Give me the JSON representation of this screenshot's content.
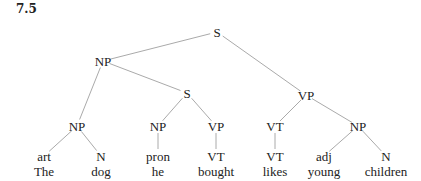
{
  "figure": {
    "label": "7.5"
  },
  "tree": {
    "nodes": [
      {
        "id": "s_root",
        "label": "S",
        "x": 217,
        "y": 32
      },
      {
        "id": "np_subj",
        "label": "NP",
        "x": 103,
        "y": 61
      },
      {
        "id": "vp_main",
        "label": "VP",
        "x": 306,
        "y": 95
      },
      {
        "id": "s_rel",
        "label": "S",
        "x": 187,
        "y": 93
      },
      {
        "id": "np_det",
        "label": "NP",
        "x": 77,
        "y": 126
      },
      {
        "id": "art",
        "label": "art",
        "x": 44,
        "y": 156
      },
      {
        "id": "n_dog",
        "label": "N",
        "x": 101,
        "y": 156
      },
      {
        "id": "np_he",
        "label": "NP",
        "x": 158,
        "y": 126
      },
      {
        "id": "pron",
        "label": "pron",
        "x": 158,
        "y": 156
      },
      {
        "id": "vp_rel",
        "label": "VP",
        "x": 216,
        "y": 126
      },
      {
        "id": "vt_bought",
        "label": "VT",
        "x": 216,
        "y": 156
      },
      {
        "id": "vt_main",
        "label": "VT",
        "x": 275,
        "y": 126
      },
      {
        "id": "vt_likes",
        "label": "VT",
        "x": 275,
        "y": 156
      },
      {
        "id": "np_obj",
        "label": "NP",
        "x": 358,
        "y": 126
      },
      {
        "id": "adj",
        "label": "adj",
        "x": 324,
        "y": 156
      },
      {
        "id": "n_children",
        "label": "N",
        "x": 386,
        "y": 156
      }
    ],
    "edges": [
      [
        "s_root",
        "np_subj"
      ],
      [
        "s_root",
        "vp_main"
      ],
      [
        "np_subj",
        "np_det"
      ],
      [
        "np_subj",
        "s_rel"
      ],
      [
        "np_det",
        "art"
      ],
      [
        "np_det",
        "n_dog"
      ],
      [
        "s_rel",
        "np_he"
      ],
      [
        "s_rel",
        "vp_rel"
      ],
      [
        "np_he",
        "pron"
      ],
      [
        "vp_rel",
        "vt_bought"
      ],
      [
        "vp_main",
        "vt_main"
      ],
      [
        "vp_main",
        "np_obj"
      ],
      [
        "vt_main",
        "vt_likes"
      ],
      [
        "np_obj",
        "adj"
      ],
      [
        "np_obj",
        "n_children"
      ]
    ],
    "words": [
      {
        "text": "The",
        "x": 44,
        "y": 171
      },
      {
        "text": "dog",
        "x": 101,
        "y": 171
      },
      {
        "text": "he",
        "x": 158,
        "y": 171
      },
      {
        "text": "bought",
        "x": 216,
        "y": 171
      },
      {
        "text": "likes",
        "x": 275,
        "y": 171
      },
      {
        "text": "young",
        "x": 324,
        "y": 171
      },
      {
        "text": "children",
        "x": 386,
        "y": 171
      }
    ]
  },
  "colors": {
    "edge": "#aaaaaa",
    "text": "#222222"
  }
}
